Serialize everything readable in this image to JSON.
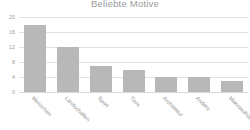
{
  "chart_data": {
    "type": "bar",
    "title": "Beliebte Motive",
    "xlabel": "",
    "ylabel": "",
    "categories": [
      "Menschen",
      "Landschaften",
      "Sport",
      "Tiere",
      "Architektur",
      "Andere",
      "Makroaufnahmen"
    ],
    "values": [
      18,
      12,
      7,
      6,
      4,
      4,
      3
    ],
    "ylim": [
      0,
      20
    ],
    "yticks": [
      20,
      16,
      12,
      8,
      4,
      0
    ],
    "grid": true,
    "legend": false,
    "bar_color": "#b8b8b8",
    "grid_color": "#e2e2e2",
    "text_color": "#9a9a9a"
  }
}
